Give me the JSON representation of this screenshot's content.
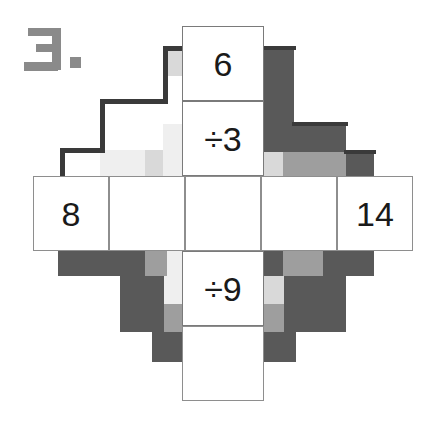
{
  "worksheet": {
    "problem_label": "3.",
    "problem_number": 3,
    "type": "cross-puzzle",
    "title": "Division cross puzzle"
  },
  "colors": {
    "ink": "#1a1a1a",
    "cell_border": "#8e8e8e",
    "label_gray": "#8a8a8a",
    "shade_dark": "#595959",
    "shade_mid": "#9e9e9e",
    "shade_light": "#d9d9d9",
    "shade_xlight": "#efefef",
    "outline_dark": "#3a3a3a",
    "page_background": "#ffffff"
  },
  "grid": {
    "columns": 5,
    "rows": 5,
    "shape": "plus",
    "cell_width": 82,
    "cell_height": 75,
    "cells": [
      {
        "id": "top",
        "row": 0,
        "col": 2,
        "value": "6",
        "kind": "number",
        "filled": true
      },
      {
        "id": "upper-middle",
        "row": 1,
        "col": 2,
        "value": "÷3",
        "kind": "operator",
        "filled": true
      },
      {
        "id": "left-outer",
        "row": 2,
        "col": 0,
        "value": "8",
        "kind": "number",
        "filled": true
      },
      {
        "id": "left-inner",
        "row": 2,
        "col": 1,
        "value": "",
        "kind": "blank",
        "filled": false
      },
      {
        "id": "center",
        "row": 2,
        "col": 2,
        "value": "",
        "kind": "blank",
        "filled": false
      },
      {
        "id": "right-inner",
        "row": 2,
        "col": 3,
        "value": "",
        "kind": "blank",
        "filled": false
      },
      {
        "id": "right-outer",
        "row": 2,
        "col": 4,
        "value": "14",
        "kind": "number",
        "filled": true
      },
      {
        "id": "lower-middle",
        "row": 3,
        "col": 2,
        "value": "÷9",
        "kind": "operator",
        "filled": true
      },
      {
        "id": "bottom",
        "row": 4,
        "col": 2,
        "value": "",
        "kind": "blank",
        "filled": false
      }
    ],
    "values": {
      "top": "6",
      "upper_operator": "÷3",
      "left": "8",
      "right": "14",
      "lower_operator": "÷9",
      "bottom": "",
      "left_inner": "",
      "center": "",
      "right_inner": ""
    }
  }
}
